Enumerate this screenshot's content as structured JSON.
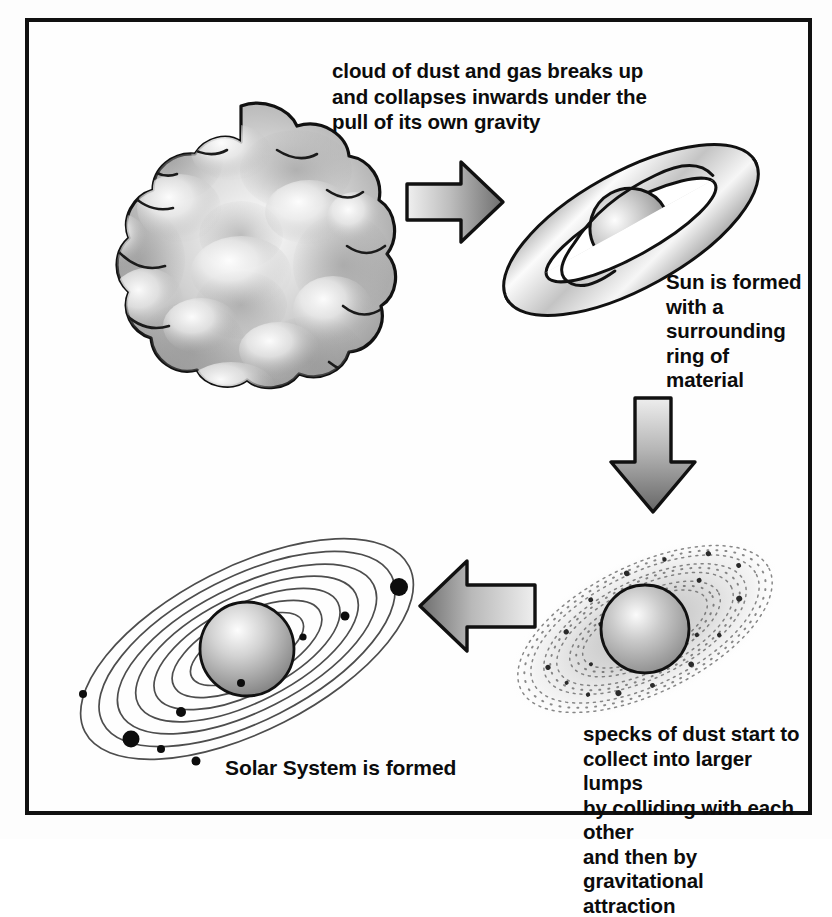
{
  "figure": {
    "frame_color": "#111111",
    "background_color": "#ffffff"
  },
  "captions": {
    "cloud": "cloud of dust and gas breaks up\nand collapses inwards under the\npull of its own gravity",
    "sun": "Sun is formed\nwith a\nsurrounding\nring of\nmaterial",
    "dust": "specks of dust start to\ncollect into larger lumps\nby colliding with each other\nand then by gravitational\nattraction",
    "solar_system": "Solar System is formed"
  },
  "stages": [
    {
      "id": "cloud",
      "name": "cloud-of-dust-and-gas",
      "order": 1
    },
    {
      "id": "ring",
      "name": "sun-with-ring-of-material",
      "order": 2
    },
    {
      "id": "dusty-disk",
      "name": "dusty-accretion-disk",
      "order": 3
    },
    {
      "id": "solar-system",
      "name": "solar-system-orbits",
      "order": 4
    }
  ],
  "arrows": [
    {
      "id": "arrow-right",
      "direction": "right",
      "from": "cloud",
      "to": "ring"
    },
    {
      "id": "arrow-down",
      "direction": "down",
      "from": "ring",
      "to": "dusty-disk"
    },
    {
      "id": "arrow-left",
      "direction": "left",
      "from": "dusty-disk",
      "to": "solar-system"
    }
  ],
  "colors": {
    "outline": "#111111",
    "arrow_light": "#e8e8e8",
    "arrow_dark": "#6e6e6e",
    "cloud_light": "#f2f2f2",
    "cloud_mid": "#b0b0b0",
    "cloud_dark": "#8a8a8a",
    "orbit_line": "#555555",
    "planet": "#0d0d0d"
  },
  "solar_system": {
    "orbit_count": 7,
    "planets": [
      {
        "size": "small"
      },
      {
        "size": "small"
      },
      {
        "size": "small"
      },
      {
        "size": "large"
      },
      {
        "size": "medium"
      },
      {
        "size": "small"
      },
      {
        "size": "large"
      },
      {
        "size": "small"
      },
      {
        "size": "small"
      }
    ]
  }
}
